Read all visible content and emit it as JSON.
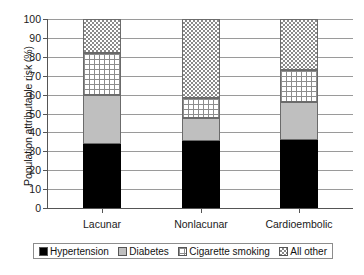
{
  "chart_data": {
    "type": "bar",
    "title": "",
    "subtitle": "",
    "xlabel": "",
    "ylabel": "Population attributable risk (%)",
    "ylim": [
      0,
      100
    ],
    "ytick_step": 10,
    "yticks": [
      0,
      10,
      20,
      30,
      40,
      50,
      60,
      70,
      80,
      90,
      100
    ],
    "grid": true,
    "stacked": true,
    "legend_position": "bottom",
    "categories": [
      "Lacunar",
      "Nonlacunar",
      "Cardioembolic"
    ],
    "series": [
      {
        "name": "Hypertension",
        "pattern": "solid-black",
        "color": "#000000",
        "values": [
          34.0,
          35.5,
          36.0
        ]
      },
      {
        "name": "Diabetes",
        "pattern": "solid-gray",
        "color": "#bfbfbf",
        "values": [
          26.0,
          12.0,
          20.0
        ]
      },
      {
        "name": "Cigarette smoking",
        "pattern": "white-grid",
        "color": "#ffffff",
        "values": [
          22.0,
          10.5,
          17.0
        ]
      },
      {
        "name": "All other",
        "pattern": "gray-checkerboard",
        "color": "#8a8a8a",
        "values": [
          18.0,
          42.0,
          27.0
        ]
      }
    ],
    "cumulative_tops": {
      "Lacunar": [
        34.0,
        60.0,
        82.0,
        100.0
      ],
      "Nonlacunar": [
        35.5,
        47.5,
        58.0,
        100.0
      ],
      "Cardioembolic": [
        36.0,
        56.0,
        73.0,
        100.0
      ]
    }
  },
  "legend": {
    "items": [
      {
        "label": "Hypertension"
      },
      {
        "label": "Diabetes"
      },
      {
        "label": "Cigarette smoking"
      },
      {
        "label": "All other"
      }
    ]
  },
  "caption": {
    "text": ""
  }
}
